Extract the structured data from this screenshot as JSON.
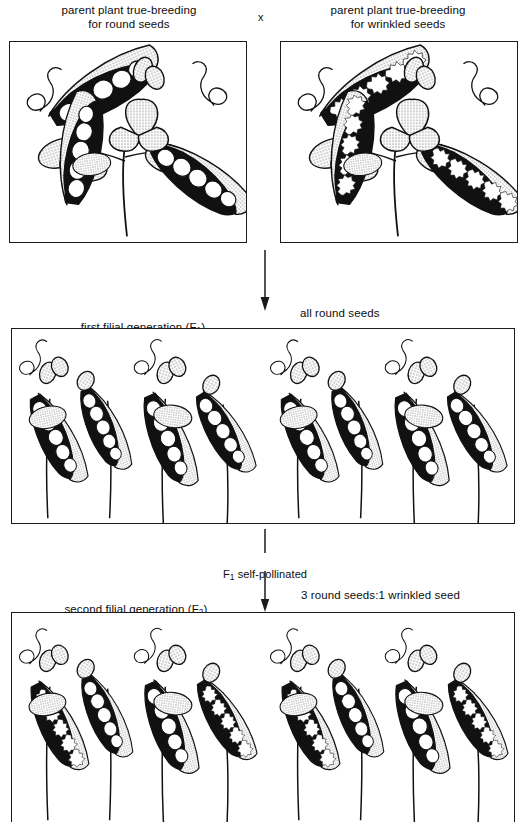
{
  "figure": {
    "type": "genetics-cross-diagram",
    "cross_symbol": "x"
  },
  "labels": {
    "parent_left": "parent plant true-breeding\nfor round seeds",
    "parent_right": "parent plant true-breeding\nfor wrinkled seeds",
    "f1_generation": "first filial generation (F",
    "f1_sub": "1",
    "f1_generation_end": ")",
    "f1_result": "all round seeds",
    "self_pollinated_pre": "F",
    "self_pollinated_sub": "1",
    "self_pollinated_post": " self-pollinated",
    "f2_generation": "second filial generation (F",
    "f2_sub": "2",
    "f2_generation_end": ")",
    "f2_result": "3 round seeds:1 wrinkled seed"
  },
  "panels": [
    {
      "id": "parent-round",
      "seed_type": "round",
      "plants": 1,
      "description": "pea plant with three open pods containing round white seeds, stippled leaves, flowers and curling tendrils"
    },
    {
      "id": "parent-wrinkled",
      "seed_type": "wrinkled",
      "plants": 1,
      "description": "pea plant with three open pods containing wrinkled star-shaped seeds on black pod interiors"
    },
    {
      "id": "f1-generation",
      "seed_type": "round",
      "plants": 8,
      "description": "row of F1 pea plants, all pods containing round seeds only"
    },
    {
      "id": "f2-generation",
      "seed_type": "mixed",
      "plants": 8,
      "description": "row of F2 pea plants, pods containing a mixture of round and wrinkled seeds in a 3 to 1 ratio"
    }
  ],
  "colors": {
    "ink": "#1a1a1a",
    "paper": "#ffffff",
    "stipple": "#9a9a9a",
    "pod_interior": "#111111",
    "seed_fill": "#ffffff"
  }
}
